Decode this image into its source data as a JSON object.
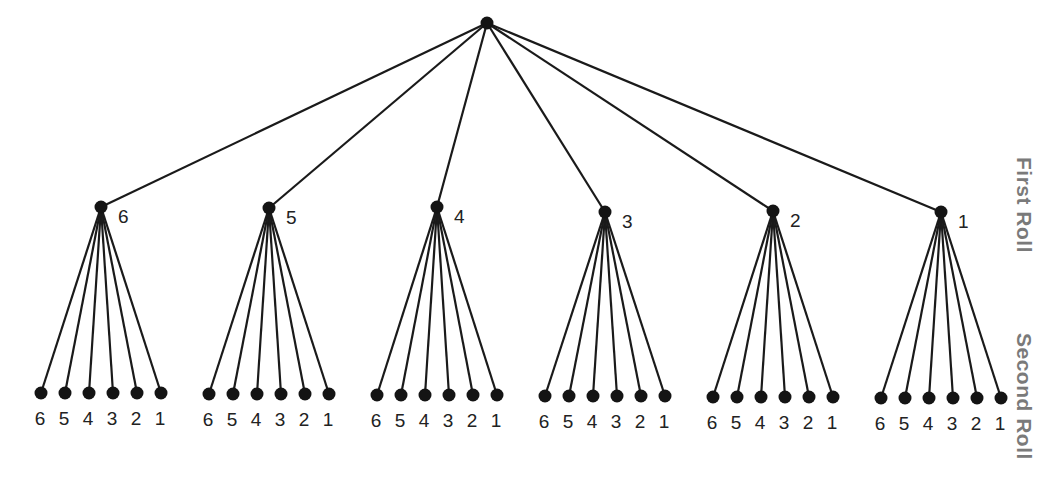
{
  "diagram": {
    "type": "probability-tree",
    "level_labels": {
      "first_roll": "First Roll",
      "second_roll": "Second Roll"
    },
    "root": {
      "x": 487,
      "y": 23
    },
    "first_roll_nodes": [
      {
        "label": "6",
        "x": 101,
        "y": 207,
        "leaf_y": 393
      },
      {
        "label": "5",
        "x": 269,
        "y": 208,
        "leaf_y": 394
      },
      {
        "label": "4",
        "x": 437,
        "y": 207,
        "leaf_y": 395
      },
      {
        "label": "3",
        "x": 605,
        "y": 212,
        "leaf_y": 396
      },
      {
        "label": "2",
        "x": 773,
        "y": 211,
        "leaf_y": 397
      },
      {
        "label": "1",
        "x": 941,
        "y": 212,
        "leaf_y": 398
      }
    ],
    "second_roll_labels": [
      "6",
      "5",
      "4",
      "3",
      "2",
      "1"
    ],
    "leaf_spacing": 24
  }
}
